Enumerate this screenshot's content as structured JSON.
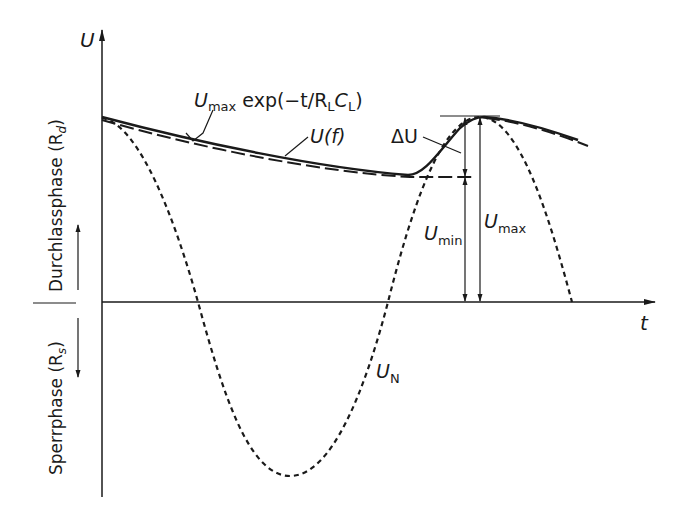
{
  "diagram": {
    "axes": {
      "y_label": "U",
      "x_label": "t"
    },
    "side_labels": {
      "upper": "Durchlassphase (R",
      "upper_sub": "d",
      "upper_close": ")",
      "lower": "Sperrphase (R",
      "lower_sub": "s",
      "lower_close": ")"
    },
    "curves": [
      {
        "name": "U_max exp(-t/R_L C_L)",
        "style": "long-dashed"
      },
      {
        "name": "U(f)",
        "style": "solid"
      },
      {
        "name": "U_N",
        "style": "short-dashed"
      }
    ],
    "annotations": {
      "exp_main": "U",
      "exp_sub": "max",
      "exp_rest": " exp(−t/R",
      "exp_sub_L1": "L",
      "exp_C": "C",
      "exp_sub_L2": "L",
      "exp_close": ")",
      "uf": "U(f)",
      "delta_u": "ΔU",
      "umin_main": "U",
      "umin_sub": "min",
      "umax_main": "U",
      "umax_sub": "max",
      "un_main": "U",
      "un_sub": "N"
    },
    "colors": {
      "ink": "#1a1a1a",
      "background": "#ffffff"
    }
  }
}
